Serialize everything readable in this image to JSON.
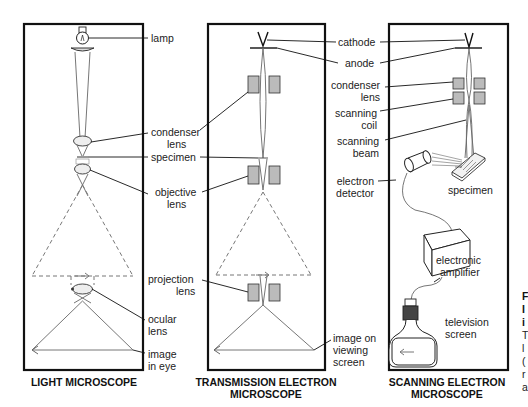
{
  "panels": [
    {
      "caption": [
        "LIGHT MICROSCOPE"
      ],
      "labels": {
        "lamp": [
          "lamp"
        ],
        "condenser": [
          "condenser",
          "lens"
        ],
        "specimen": [
          "specimen"
        ],
        "objective": [
          "objective",
          "lens"
        ],
        "projection": [
          "projection",
          "lens"
        ],
        "ocular": [
          "ocular",
          "lens"
        ],
        "image": [
          "image",
          "in eye"
        ]
      }
    },
    {
      "caption": [
        "TRANSMISSION ELECTRON",
        "MICROSCOPE"
      ],
      "labels": {
        "cathode": [
          "cathode"
        ],
        "anode": [
          "anode"
        ],
        "image": [
          "image on",
          "viewing",
          "screen"
        ]
      }
    },
    {
      "caption": [
        "SCANNING ELECTRON",
        "MICROSCOPE"
      ],
      "labels": {
        "condenser": [
          "condenser",
          "lens"
        ],
        "scanning_coil": [
          "scanning",
          "coil"
        ],
        "scanning_beam": [
          "scanning",
          "beam"
        ],
        "electron_detector": [
          "electron",
          "detector"
        ],
        "specimen": [
          "specimen"
        ],
        "electronic_amplifier": [
          "electronic",
          "amplifier"
        ],
        "television_screen": [
          "television",
          "screen"
        ]
      }
    }
  ],
  "side_text": {
    "bold": [
      "F",
      "I",
      "i"
    ],
    "normal": [
      "T",
      "l",
      "(",
      "r",
      "a"
    ]
  },
  "colors": {
    "frame": "#111111",
    "coil": "#bbbbbb",
    "ray": "#666666"
  }
}
